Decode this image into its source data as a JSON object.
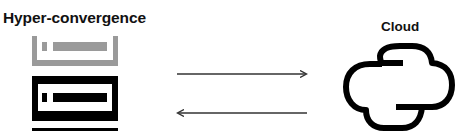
{
  "diagram": {
    "left_label": "Hyper-convergence",
    "right_label": "Cloud",
    "left_node": {
      "type": "server-stack",
      "components": [
        "gray-server-tray",
        "black-server-unit",
        "base-line"
      ]
    },
    "right_node": {
      "type": "cloud"
    },
    "edges": [
      {
        "from": "Hyper-convergence",
        "to": "Cloud",
        "direction": "right"
      },
      {
        "from": "Cloud",
        "to": "Hyper-convergence",
        "direction": "left"
      }
    ],
    "colors": {
      "primary": "#000000",
      "secondary": "#9a9a9a",
      "arrow": "#333333",
      "text": "#111111",
      "background": "#ffffff"
    }
  }
}
